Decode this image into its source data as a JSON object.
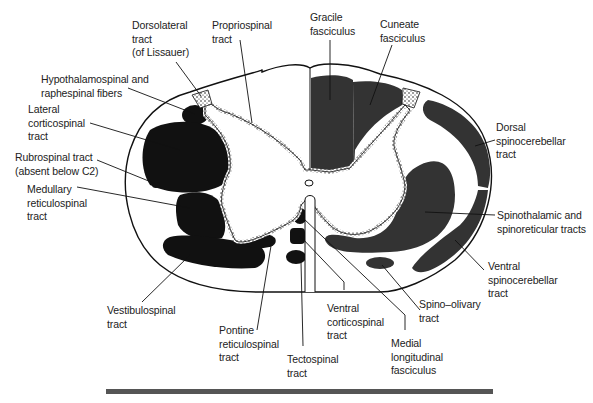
{
  "figure": {
    "colors": {
      "descending_tracts": "#111111",
      "ascending_tracts": "#333333",
      "outline": "#111111",
      "background": "#ffffff",
      "caption_bar": "#555555"
    }
  },
  "labels": {
    "dorsolateral": "Dorsolateral\ntract\n(of Lissauer)",
    "propriospinal": "Propriospinal\ntract",
    "gracile": "Gracile\nfasciculus",
    "cuneate": "Cuneate\nfasciculus",
    "hypothalamospinal": "Hypothalamospinal and\nraphespinal fibers",
    "lateral_corticospinal": "Lateral\ncorticospinal\ntract",
    "rubrospinal": "Rubrospinal tract\n(absent below C2)",
    "medullary_reticulospinal": "Medullary\nreticulospinal\ntract",
    "dorsal_spinocerebellar": "Dorsal\nspinocerebellar\ntract",
    "spinothalamic": "Spinothalamic and\nspinoreticular tracts",
    "ventral_spinocerebellar": "Ventral\nspinocerebellar\ntract",
    "vestibulospinal": "Vestibulospinal\ntract",
    "pontine_reticulospinal": "Pontine\nreticulospinal\ntract",
    "tectospinal": "Tectospinal\ntract",
    "ventral_corticospinal": "Ventral\ncorticospinal\ntract",
    "medial_longitudinal": "Medial\nlongitudinal\nfasciculus",
    "spino_olivary": "Spino–olivary\ntract"
  }
}
